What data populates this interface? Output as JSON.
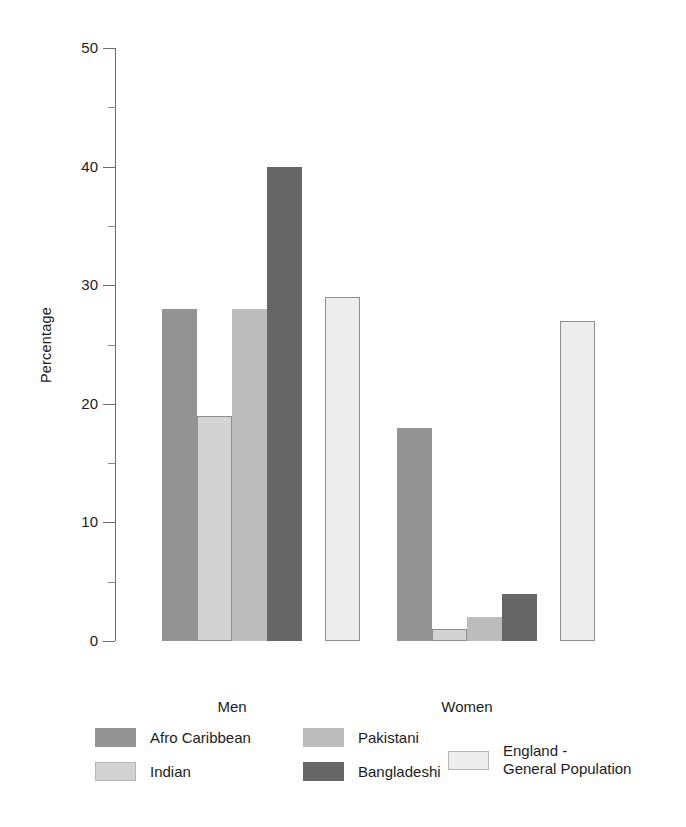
{
  "chart_data": {
    "type": "bar",
    "title": "",
    "subtitle": "",
    "xlabel": "",
    "ylabel": "Percentage",
    "ylim": [
      0,
      50
    ],
    "ytick_major": [
      0,
      10,
      20,
      30,
      40,
      50
    ],
    "ytick_minor": [
      5,
      15,
      25,
      35,
      45
    ],
    "grid": false,
    "legend_position": "bottom",
    "categories": [
      "Men",
      "Women"
    ],
    "series": [
      {
        "name": "Afro Caribbean",
        "color": "#949494",
        "values": [
          28,
          18
        ]
      },
      {
        "name": "Indian",
        "color": "#d3d3d3",
        "values": [
          19,
          1
        ]
      },
      {
        "name": "Pakistani",
        "color": "#bcbcbc",
        "values": [
          28,
          2
        ]
      },
      {
        "name": "Bangladeshi",
        "color": "#666666",
        "values": [
          40,
          4
        ]
      },
      {
        "name": "England -\nGeneral Population",
        "color": "#ededed",
        "values": [
          29,
          27
        ]
      }
    ]
  },
  "axis": {
    "y_label": "Percentage",
    "y_ticks": [
      "50",
      "40",
      "30",
      "20",
      "10",
      "0"
    ]
  },
  "groups": [
    {
      "label": "Men"
    },
    {
      "label": "Women"
    }
  ],
  "legend": {
    "items": [
      {
        "label": "Afro Caribbean",
        "color": "#949494"
      },
      {
        "label": "Indian",
        "color": "#d3d3d3"
      },
      {
        "label": "Pakistani",
        "color": "#bcbcbc"
      },
      {
        "label": "Bangladeshi",
        "color": "#666666"
      },
      {
        "label": "England -\nGeneral Population",
        "color": "#ededed"
      }
    ]
  },
  "colors": {
    "axis": "#6d6d6d",
    "text": "#1c1c1c",
    "background": "#ffffff",
    "bar_outline": "#8f8f8f"
  }
}
